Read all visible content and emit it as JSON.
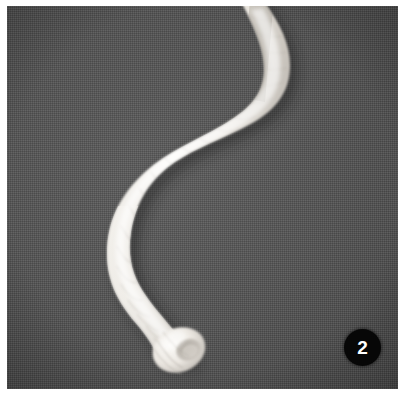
{
  "figure": {
    "domain": "Natural-Image",
    "kind": "macro-photograph",
    "subject_label": "pale worm-like specimen",
    "badge": {
      "number": "2",
      "shape": "circle",
      "background_color": "#070707",
      "text_color": "#ffffff",
      "position": "bottom-right"
    },
    "canvas": {
      "width": 406,
      "height": 398,
      "matte_color": "#ffffff"
    },
    "photo": {
      "left": 7,
      "top": 6,
      "width": 391,
      "height": 383,
      "background_color": "#4d4d4d",
      "background_description": "dark gray woven fabric texture"
    },
    "specimen": {
      "body_color": "#f2f0ec",
      "shadow_color": "#2e2e2e",
      "description": "elongated S-curved pale body entering at top edge, arcing right then descending to a blunt rounded anterior end at lower left-center",
      "anterior_tip": {
        "x": 180,
        "y": 345
      },
      "entry_point": {
        "x": 258,
        "y": 0
      }
    }
  }
}
